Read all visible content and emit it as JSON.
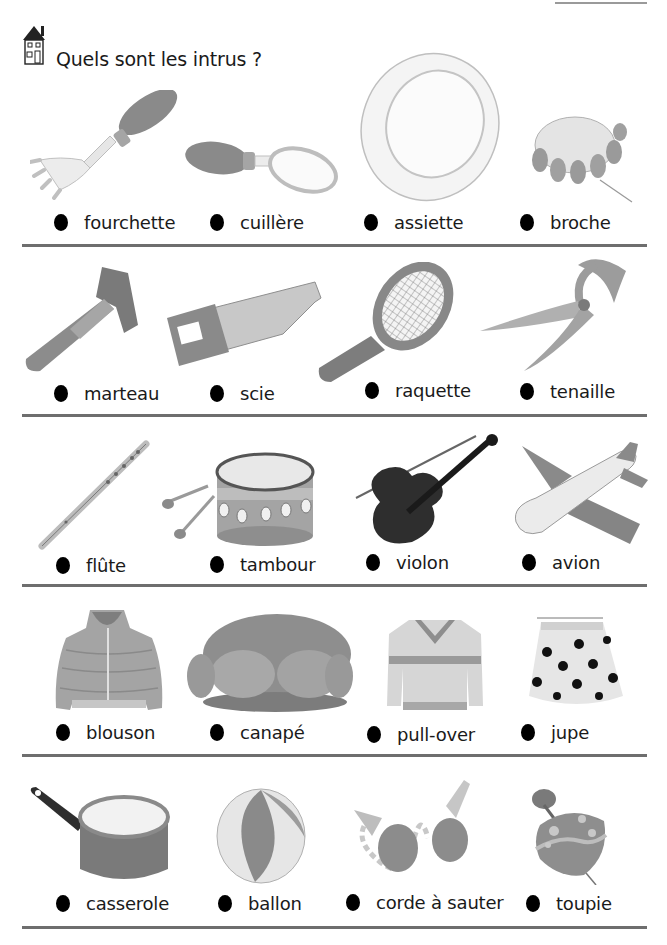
{
  "page": {
    "title": "Quels sont les intrus ?",
    "header_icon": "house-icon"
  },
  "rows": [
    {
      "items": [
        {
          "label": "fourchette",
          "icon": "fork-icon"
        },
        {
          "label": "cuillère",
          "icon": "spoon-icon"
        },
        {
          "label": "assiette",
          "icon": "plate-icon"
        },
        {
          "label": "broche",
          "icon": "brooch-icon"
        }
      ]
    },
    {
      "items": [
        {
          "label": "marteau",
          "icon": "hammer-icon"
        },
        {
          "label": "scie",
          "icon": "saw-icon"
        },
        {
          "label": "raquette",
          "icon": "racket-icon"
        },
        {
          "label": "tenaille",
          "icon": "pincers-icon"
        }
      ]
    },
    {
      "items": [
        {
          "label": "flûte",
          "icon": "flute-icon"
        },
        {
          "label": "tambour",
          "icon": "drum-icon"
        },
        {
          "label": "violon",
          "icon": "violin-icon"
        },
        {
          "label": "avion",
          "icon": "airplane-icon"
        }
      ]
    },
    {
      "items": [
        {
          "label": "blouson",
          "icon": "jacket-icon"
        },
        {
          "label": "canapé",
          "icon": "sofa-icon"
        },
        {
          "label": "pull-over",
          "icon": "sweater-icon"
        },
        {
          "label": "jupe",
          "icon": "skirt-icon"
        }
      ]
    },
    {
      "items": [
        {
          "label": "casserole",
          "icon": "saucepan-icon"
        },
        {
          "label": "ballon",
          "icon": "ball-icon"
        },
        {
          "label": "corde à sauter",
          "icon": "jump-rope-icon"
        },
        {
          "label": "toupie",
          "icon": "spinning-top-icon"
        }
      ]
    }
  ]
}
